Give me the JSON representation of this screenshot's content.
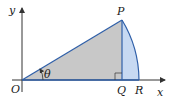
{
  "diagram": {
    "type": "sector-triangle-geometry",
    "labels": {
      "y_axis": "y",
      "x_axis": "x",
      "origin": "O",
      "point_p": "P",
      "point_q": "Q",
      "point_r": "R",
      "angle": "θ"
    },
    "colors": {
      "triangle_fill": "#c8c8c8",
      "sector_fill": "#c7d9f2",
      "line": "#2f5fa8",
      "axis": "#333333"
    }
  }
}
